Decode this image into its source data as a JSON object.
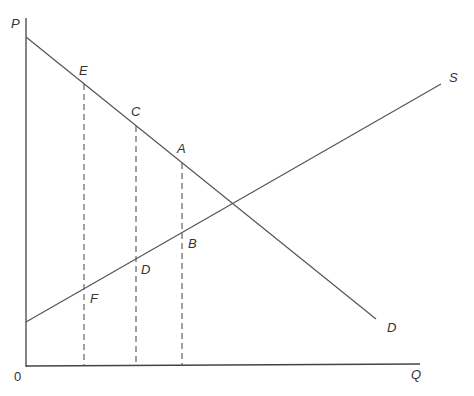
{
  "diagram": {
    "type": "supply-demand",
    "axes": {
      "y_label": "P",
      "x_label": "Q",
      "origin_label": "0"
    },
    "curves": {
      "demand_label": "D",
      "supply_label": "S"
    },
    "points": {
      "E": "E",
      "C": "C",
      "A": "A",
      "B": "B",
      "D": "D",
      "F": "F"
    }
  }
}
